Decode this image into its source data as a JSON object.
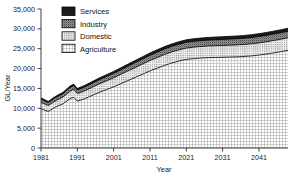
{
  "chart_data": {
    "type": "area",
    "stacked": true,
    "title": "",
    "xlabel": "Year",
    "ylabel": "GL/Year",
    "xlim": [
      1981,
      2049
    ],
    "ylim": [
      0,
      35000
    ],
    "grid": false,
    "legend_position": "top-left",
    "ytick_labels": [
      "0",
      "5,000",
      "10,000",
      "15,000",
      "20,000",
      "25,000",
      "30,000",
      "35,000"
    ],
    "ytick_values": [
      0,
      5000,
      10000,
      15000,
      20000,
      25000,
      30000,
      35000
    ],
    "xtick_labels": [
      "1981",
      "1991",
      "2001",
      "2011",
      "2021",
      "2031",
      "2041"
    ],
    "xtick_values": [
      1981,
      1991,
      2001,
      2011,
      2021,
      2031,
      2041
    ],
    "x": [
      1981,
      1983,
      1985,
      1987,
      1989,
      1990,
      1991,
      1993,
      1995,
      1997,
      1999,
      2001,
      2003,
      2005,
      2007,
      2009,
      2011,
      2013,
      2015,
      2017,
      2019,
      2021,
      2023,
      2025,
      2027,
      2029,
      2031,
      2033,
      2035,
      2037,
      2039,
      2041,
      2043,
      2045,
      2047,
      2049
    ],
    "series": [
      {
        "name": "Agriculture",
        "fill": "#e8e8e8",
        "values": [
          9900,
          9200,
          10300,
          11100,
          12400,
          12800,
          11800,
          12400,
          13200,
          14000,
          14700,
          15400,
          16200,
          17000,
          17800,
          18600,
          19400,
          20100,
          20800,
          21400,
          21900,
          22300,
          22500,
          22650,
          22750,
          22800,
          22850,
          22900,
          22950,
          23050,
          23200,
          23400,
          23650,
          23950,
          24250,
          24600
        ]
      },
      {
        "name": "Domestic",
        "fill": "#d2d2d2",
        "values": [
          1600,
          1500,
          1600,
          1700,
          1900,
          1950,
          1900,
          1980,
          2050,
          2130,
          2200,
          2280,
          2350,
          2420,
          2490,
          2560,
          2630,
          2690,
          2740,
          2790,
          2830,
          2860,
          2890,
          2910,
          2930,
          2950,
          2970,
          2990,
          3010,
          3030,
          3050,
          3070,
          3090,
          3110,
          3130,
          3150
        ]
      },
      {
        "name": "Industry",
        "fill": "#8d8d8d",
        "values": [
          780,
          740,
          790,
          840,
          920,
          950,
          920,
          960,
          1000,
          1040,
          1080,
          1120,
          1160,
          1200,
          1240,
          1280,
          1320,
          1350,
          1380,
          1400,
          1420,
          1440,
          1460,
          1475,
          1490,
          1505,
          1520,
          1535,
          1550,
          1565,
          1580,
          1595,
          1610,
          1625,
          1640,
          1655
        ]
      },
      {
        "name": "Services",
        "fill": "#1b1b1b",
        "values": [
          320,
          300,
          320,
          340,
          380,
          390,
          380,
          400,
          420,
          440,
          460,
          480,
          500,
          520,
          540,
          560,
          580,
          595,
          610,
          620,
          630,
          640,
          650,
          658,
          666,
          674,
          682,
          690,
          698,
          706,
          714,
          722,
          730,
          738,
          746,
          754
        ]
      }
    ],
    "legend_entries": [
      {
        "label": "Services",
        "swatch": "#1b1b1b"
      },
      {
        "label": "Industry",
        "swatch": "#8d8d8d"
      },
      {
        "label": "Domestic",
        "swatch": "#d2d2d2"
      },
      {
        "label": "Agriculture",
        "swatch": "#e8e8e8"
      }
    ]
  }
}
